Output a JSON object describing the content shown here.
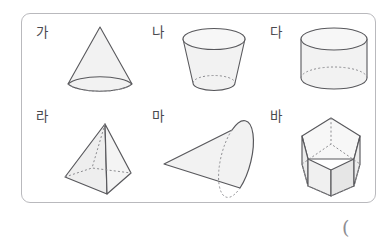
{
  "page": {
    "trailing_symbol": "(",
    "border_color": "#b9b9bd",
    "fill_color": "#f2f2f2",
    "stroke_color": "#58585c",
    "hidden_edge_color": "#8c8c90",
    "label_color": "#4a4a4f",
    "background": "#ffffff"
  },
  "figures": [
    {
      "label": "가",
      "shape": "cone",
      "shape_name": "cone-upright",
      "description": "Upright circular cone with dotted hidden base ellipse",
      "row": 1,
      "column": 1
    },
    {
      "label": "나",
      "shape": "frustum",
      "shape_name": "cone-frustum",
      "description": "Truncated cone (frustum) narrowing toward the bottom",
      "row": 1,
      "column": 2
    },
    {
      "label": "다",
      "shape": "cylinder",
      "shape_name": "cylinder",
      "description": "Upright circular cylinder with dotted hidden base ellipse",
      "row": 1,
      "column": 3
    },
    {
      "label": "라",
      "shape": "pyramid",
      "shape_name": "square-pyramid",
      "description": "Square pyramid with dotted hidden base edges",
      "row": 2,
      "column": 1
    },
    {
      "label": "마",
      "shape": "cone",
      "shape_name": "cone-sideways",
      "description": "Circular cone lying on its side, apex pointing left",
      "row": 2,
      "column": 2
    },
    {
      "label": "바",
      "shape": "prism",
      "shape_name": "pentagonal-prism",
      "description": "Pentagonal prism with dotted hidden edges",
      "row": 2,
      "column": 3
    }
  ]
}
